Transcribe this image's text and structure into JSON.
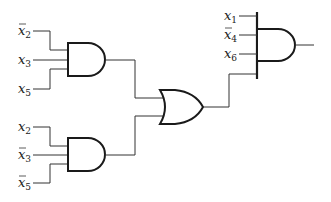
{
  "diagram": {
    "type": "logic-circuit",
    "colors": {
      "line": "#1a1a1a",
      "background": "#ffffff"
    },
    "gates": [
      {
        "id": "and1",
        "type": "AND",
        "inputs": [
          "x̄2",
          "x3",
          "x5"
        ]
      },
      {
        "id": "and2",
        "type": "AND",
        "inputs": [
          "x2",
          "x̄3",
          "x̄5"
        ]
      },
      {
        "id": "or1",
        "type": "OR",
        "inputs": [
          "and1",
          "and2"
        ]
      },
      {
        "id": "and3",
        "type": "AND",
        "inputs": [
          "x1",
          "x̄4",
          "x6",
          "or1"
        ]
      }
    ],
    "labels": {
      "and1_in1": {
        "var": "x",
        "sub": "2",
        "negated": true
      },
      "and1_in2": {
        "var": "x",
        "sub": "3",
        "negated": false
      },
      "and1_in3": {
        "var": "x",
        "sub": "5",
        "negated": false
      },
      "and2_in1": {
        "var": "x",
        "sub": "2",
        "negated": false
      },
      "and2_in2": {
        "var": "x",
        "sub": "3",
        "negated": true
      },
      "and2_in3": {
        "var": "x",
        "sub": "5",
        "negated": true
      },
      "and3_in1": {
        "var": "x",
        "sub": "1",
        "negated": false
      },
      "and3_in2": {
        "var": "x",
        "sub": "4",
        "negated": true
      },
      "and3_in3": {
        "var": "x",
        "sub": "6",
        "negated": false
      }
    }
  }
}
